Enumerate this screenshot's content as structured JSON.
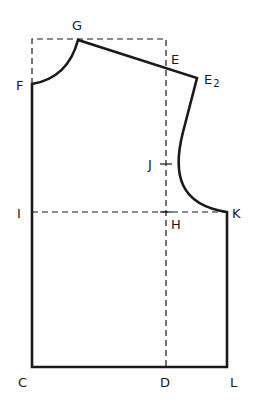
{
  "diagram": {
    "labels": {
      "G": "G",
      "F": "F",
      "E": "E",
      "E2_main": "E",
      "E2_sub": "2",
      "J": "J",
      "I": "I",
      "H": "H",
      "K": "K",
      "C": "C",
      "D": "D",
      "L": "L"
    },
    "colors": {
      "line": "#1a1a1a",
      "background": "#ffffff"
    }
  }
}
